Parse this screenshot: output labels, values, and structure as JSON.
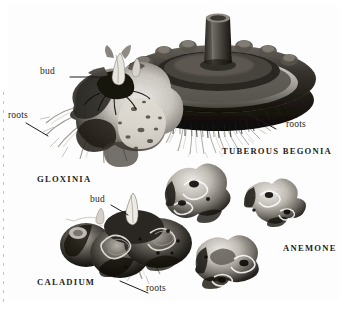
{
  "figure": {
    "kind": "botanical-illustration-plate",
    "medium": "halftone engraving / grayscale scan",
    "background_color": "#fdfdfd",
    "ink_color": "#1d1d1d",
    "border_color": "#8d8d8d"
  },
  "specimens": [
    {
      "id": "gloxinia",
      "caption": "GLOXINIA",
      "description": "Lumpy rounded tuber, mottled light and dark, sprouting bud on top with pale roots trailing left"
    },
    {
      "id": "tuberous-begonia",
      "caption": "TUBEROUS BEGONIA",
      "description": "Large concave saucer-shaped tuber with central stem stub and dense fine roots beneath"
    },
    {
      "id": "caladium",
      "caption": "CALADIUM",
      "description": "Dark knobby elongated tuber with a single pointed bud and long pale roots"
    },
    {
      "id": "anemone",
      "caption": "ANEMONE",
      "description": "Three small irregular knobby corms"
    }
  ],
  "callouts": [
    {
      "id": "bud-gloxinia",
      "text": "bud",
      "style": "lowercase"
    },
    {
      "id": "roots-gloxinia",
      "text": "roots",
      "style": "lowercase"
    },
    {
      "id": "roots-begonia",
      "text": "roots",
      "style": "lowercase"
    },
    {
      "id": "bud-caladium",
      "text": "bud",
      "style": "lowercase"
    },
    {
      "id": "roots-caladium",
      "text": "roots",
      "style": "lowercase"
    }
  ]
}
